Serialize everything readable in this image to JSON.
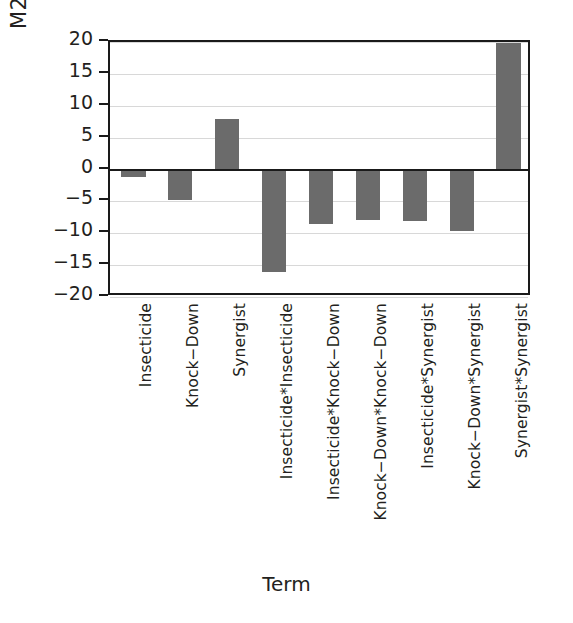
{
  "chart_data": {
    "type": "bar",
    "title": "",
    "xlabel": "Term",
    "ylabel": "M24 Estimates",
    "ylim": [
      -20,
      20
    ],
    "yticks": [
      20,
      15,
      10,
      5,
      0,
      -5,
      -10,
      -15,
      -20
    ],
    "ytick_labels": [
      "20",
      "15",
      "10",
      "5",
      "0",
      "−5",
      "−10",
      "−15",
      "−20"
    ],
    "grid": true,
    "legend": "none",
    "bar_color": "#6b6b6b",
    "categories": [
      "Insecticide",
      "Knock−Down",
      "Synergist",
      "Insecticide*Insecticide",
      "Insecticide*Knock−Down",
      "Knock−Down*Knock−Down",
      "Insecticide*Synergist",
      "Knock−Down*Synergist",
      "Synergist*Synergist"
    ],
    "values": [
      -1.2,
      -4.7,
      7.9,
      -16.0,
      -8.6,
      -7.9,
      -8.0,
      -9.7,
      19.8
    ]
  }
}
